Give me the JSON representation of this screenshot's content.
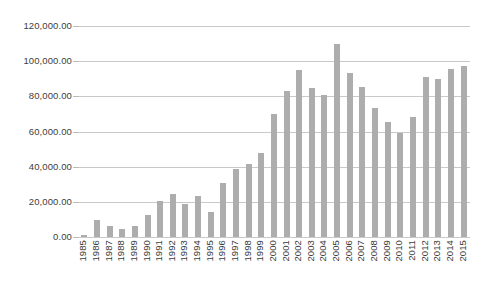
{
  "chart_data": {
    "type": "bar",
    "title": "",
    "subtitle": "",
    "xlabel": "",
    "ylabel": "",
    "ylim": [
      0,
      120000
    ],
    "grid": true,
    "legend": false,
    "legend_position": "none",
    "bar_color": "#adadad",
    "gridline_color": "#c9c9c9",
    "y_ticks": [
      0,
      20000,
      40000,
      60000,
      80000,
      100000,
      120000
    ],
    "y_tick_labels": [
      "0.00",
      "20,000.00",
      "40,000.00",
      "60,000.00",
      "80,000.00",
      "100,000.00",
      "120,000.00"
    ],
    "categories": [
      "1985",
      "1986",
      "1987",
      "1988",
      "1989",
      "1990",
      "1991",
      "1992",
      "1993",
      "1994",
      "1995",
      "1996",
      "1997",
      "1998",
      "1999",
      "2000",
      "2001",
      "2002",
      "2003",
      "2004",
      "2005",
      "2006",
      "2007",
      "2008",
      "2009",
      "2010",
      "2011",
      "2012",
      "2013",
      "2014",
      "2015"
    ],
    "values": [
      1200,
      9500,
      6000,
      4500,
      6500,
      12500,
      20500,
      24500,
      18500,
      23500,
      14000,
      30500,
      38500,
      41500,
      48000,
      70000,
      83000,
      95000,
      84500,
      80500,
      110000,
      93000,
      85500,
      73500,
      65500,
      59000,
      68500,
      91000,
      90000,
      95500,
      97500
    ]
  }
}
